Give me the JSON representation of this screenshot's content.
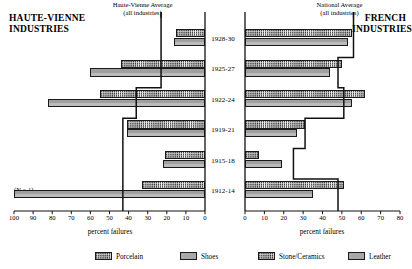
{
  "left_panel": {
    "title": "HAUTE-VIENNE\nINDUSTRIES",
    "title_line1": "HAUTE-VIENNE",
    "title_line2": "INDUSTRIES",
    "avg_label_line1": "Haute-Vienne Average",
    "avg_label_line2": "(all industries)",
    "axis_title": "percent failures",
    "n_note": "(N = 1)"
  },
  "right_panel": {
    "title_line1": "FRENCH",
    "title_line2": "INDUSTRIES",
    "avg_label_line1": "National Average",
    "avg_label_line2": "(all industries)",
    "axis_title": "percent failures"
  },
  "legend": [
    {
      "label": "Porcelain",
      "pattern": "dotted",
      "color": "#fdfdfd"
    },
    {
      "label": "Shoes",
      "pattern": "solidgray",
      "color": "#a8a8a8"
    },
    {
      "label": "Stone/Ceramics",
      "pattern": "dotted",
      "color": "#fdfdfd"
    },
    {
      "label": "Leather",
      "pattern": "solidgray",
      "color": "#a8a8a8"
    }
  ],
  "chart_data": {
    "type": "bar",
    "orientation": "horizontal",
    "layout": "back-to-back dual panel, shared category axis of year groups",
    "categories": [
      "1928-30",
      "1925-27",
      "1922-24",
      "1919-21",
      "1915-18",
      "1912-14"
    ],
    "panels": [
      {
        "name": "HAUTE-VIENNE INDUSTRIES",
        "side": "left",
        "xlabel": "percent failures",
        "xlim": [
          100,
          0
        ],
        "x_reversed": true,
        "ticks": [
          100,
          90,
          80,
          70,
          60,
          50,
          40,
          30,
          20,
          10,
          0
        ],
        "grid": false,
        "series": [
          {
            "name": "Porcelain",
            "pattern": "dotted",
            "values": [
              15,
              44,
              55,
              41,
              21,
              33
            ]
          },
          {
            "name": "Shoes",
            "pattern": "solidgray",
            "values": [
              16,
              60,
              82,
              41,
              22,
              100
            ]
          }
        ],
        "overlay": {
          "name": "Haute-Vienne Average (all industries)",
          "type": "step-line",
          "values": [
            23,
            23,
            36,
            43,
            43,
            43
          ]
        },
        "notes": [
          {
            "category": "1912-14",
            "text": "(N = 1)"
          }
        ]
      },
      {
        "name": "FRENCH INDUSTRIES",
        "side": "right",
        "xlabel": "percent failures",
        "xlim": [
          0,
          80
        ],
        "x_reversed": false,
        "ticks": [
          0,
          10,
          20,
          30,
          40,
          50,
          60,
          70,
          80
        ],
        "grid": false,
        "series": [
          {
            "name": "Stone/Ceramics",
            "pattern": "dotted",
            "values": [
              55,
              50,
              62,
              31,
              7,
              51
            ]
          },
          {
            "name": "Leather",
            "pattern": "solidgray",
            "values": [
              53,
              44,
              55,
              27,
              19,
              35
            ]
          }
        ],
        "overlay": {
          "name": "National Average (all industries)",
          "type": "step-line",
          "values": [
            56,
            48,
            51,
            31,
            25,
            48
          ]
        }
      }
    ]
  }
}
